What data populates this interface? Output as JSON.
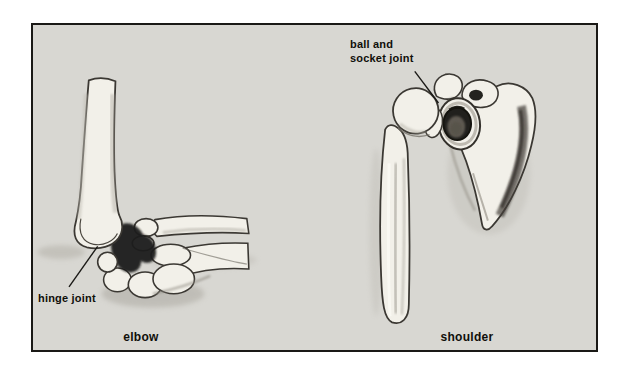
{
  "figure": {
    "annotations": {
      "ball_socket": "ball and\nsocket joint",
      "hinge": "hinge joint"
    },
    "captions": {
      "elbow": "elbow",
      "shoulder": "shoulder"
    },
    "colors": {
      "page_background": "#ffffff",
      "panel_background": "#d8d7d2",
      "frame_border": "#1a1916",
      "ink": "#100f0a",
      "bone": "#f2f0e9"
    }
  }
}
